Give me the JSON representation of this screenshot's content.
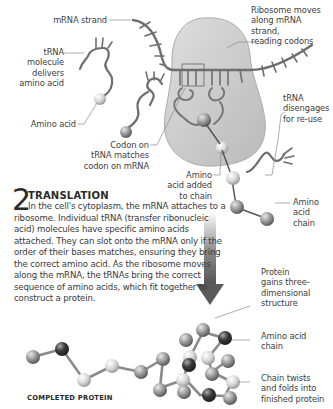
{
  "labels": {
    "mrna_strand": "mRNA strand",
    "ribosome": [
      "Ribosome moves",
      "along mRNA strand,",
      "reading codons"
    ],
    "trna_delivers": [
      "tRNA",
      "molecule",
      "delivers",
      "amino acid"
    ],
    "amino_acid": "Amino acid",
    "trna_disengages": [
      "tRNA",
      "disengages",
      "for re-use"
    ],
    "codon_match": [
      "Codon on",
      "tRNA matches",
      "codon on mRNA"
    ],
    "amino_added": [
      "Amino",
      "acid added",
      "to chain"
    ],
    "amino_chain_top": [
      "Amino",
      "acid",
      "chain"
    ],
    "protein_3d": [
      "Protein",
      "gains three-",
      "dimensional",
      "structure"
    ],
    "amino_chain_bottom": [
      "Amino acid",
      "chain"
    ],
    "chain_twists": [
      "Chain twists",
      "and folds into",
      "finished protein"
    ]
  },
  "section": {
    "number": "2",
    "title": "TRANSLATION",
    "body": "In the cell's cytoplasm, the mRNA attaches to a ribosome. Individual tRNA (transfer ribonucleic acid) molecules have specific amino acids attached. They can slot onto the mRNA only if the order of their bases matches, ensuring they bring the correct amino acid. As the ribosome moves along the mRNA, the tRNAs bring the correct sequence of amino acids, which fit together to construct a protein."
  },
  "caption": "COMPLETED PROTEIN",
  "colors": {
    "ribosome_fill": "#c9c9c9",
    "strand": "#6e6e6e",
    "sphere_light": "#dcdcdc",
    "sphere_mid": "#9a9a9a",
    "sphere_dark": "#3a3a3a",
    "arrow": "#5a5a5a",
    "text": "#3a3a3a"
  }
}
